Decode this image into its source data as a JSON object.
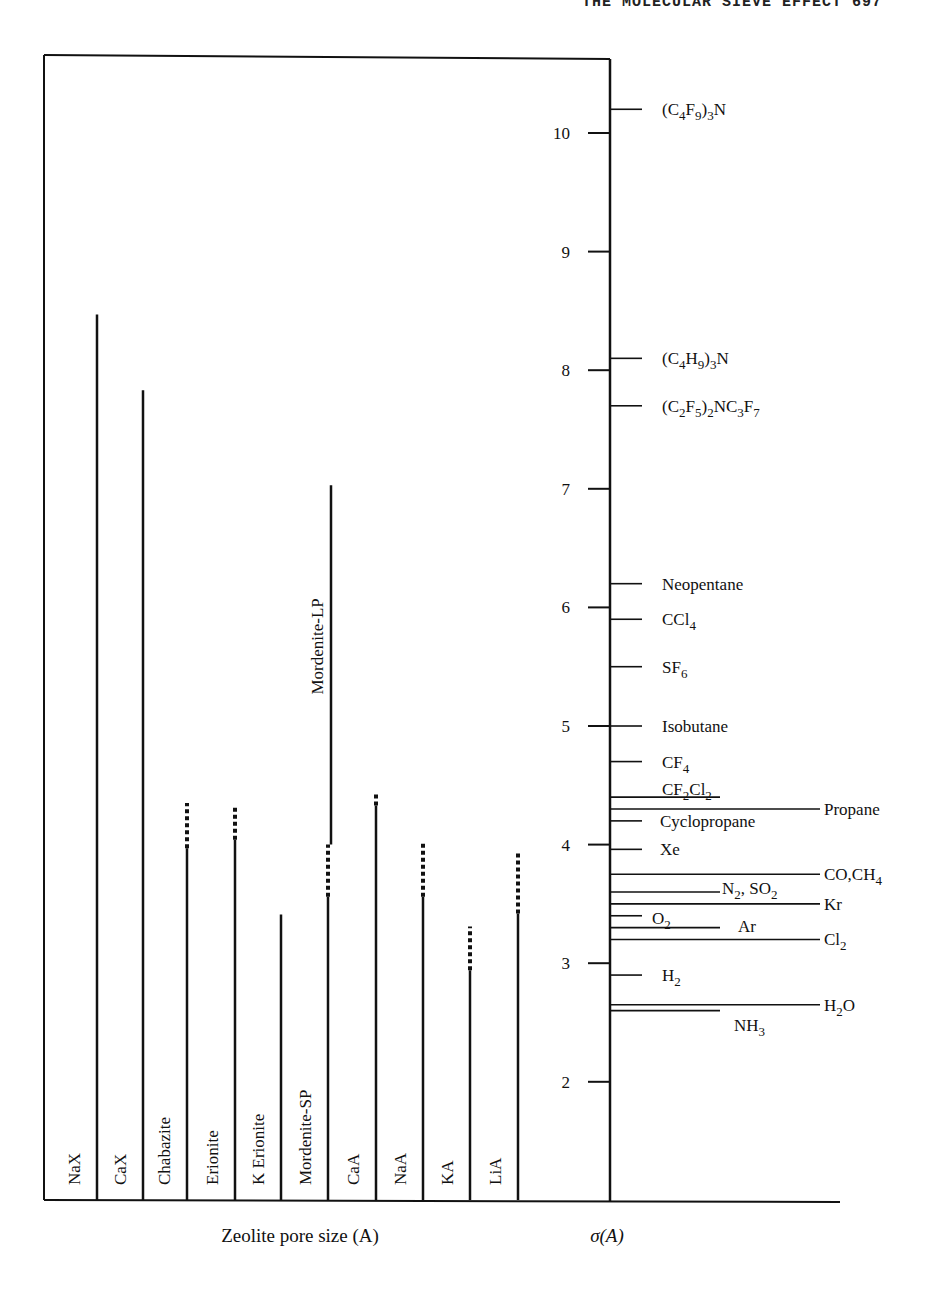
{
  "page": {
    "running_header": "THE MOLECULAR SIEVE EFFECT 697"
  },
  "chart_data": {
    "type": "bar",
    "title": "",
    "xlabel": "Zeolite pore size (A)",
    "ylabel": "σ(A)",
    "ylim": [
      1,
      10.6
    ],
    "y_ticks": [
      2,
      3,
      4,
      5,
      6,
      7,
      8,
      9,
      10
    ],
    "grid": false,
    "legend": "none",
    "categories": [
      "NaX",
      "CaX",
      "Chabazite",
      "Erionite",
      "K Erionite",
      "Mordenite-SP",
      "CaA",
      "NaA",
      "KA",
      "LiA"
    ],
    "series": [
      {
        "name": "Zeolite pore size (solid)",
        "values": [
          8.47,
          7.83,
          3.97,
          4.04,
          3.41,
          3.56,
          4.33,
          3.56,
          2.94,
          3.42
        ]
      },
      {
        "name": "Zeolite pore size (dashed upper range)",
        "values": [
          null,
          null,
          4.35,
          4.33,
          null,
          4.0,
          4.43,
          4.01,
          3.31,
          3.95
        ]
      }
    ],
    "extra_bars": [
      {
        "name": "Mordenite-LP",
        "from": 4.0,
        "to": 7.03,
        "category_index": 5
      }
    ],
    "molecules": [
      {
        "label": "(C4F9)3N",
        "sigma": 10.2,
        "line": "short"
      },
      {
        "label": "(C4H9)3N",
        "sigma": 8.1,
        "line": "short"
      },
      {
        "label": "(C2F5)2NC3F7",
        "sigma": 7.7,
        "line": "short"
      },
      {
        "label": "Neopentane",
        "sigma": 6.2,
        "line": "short"
      },
      {
        "label": "CCl4",
        "sigma": 5.9,
        "line": "short"
      },
      {
        "label": "SF6",
        "sigma": 5.5,
        "line": "short"
      },
      {
        "label": "Isobutane",
        "sigma": 5.0,
        "line": "short"
      },
      {
        "label": "CF4",
        "sigma": 4.7,
        "line": "short"
      },
      {
        "label": "CF2Cl2",
        "sigma": 4.4,
        "line": "medium"
      },
      {
        "label": "Propane",
        "sigma": 4.3,
        "line": "long"
      },
      {
        "label": "Cyclopropane",
        "sigma": 4.2,
        "line": "short"
      },
      {
        "label": "Xe",
        "sigma": 3.96,
        "line": "short"
      },
      {
        "label": "CO,CH4",
        "sigma": 3.75,
        "line": "long"
      },
      {
        "label": "N2, SO2",
        "sigma": 3.6,
        "line": "medium"
      },
      {
        "label": "Kr",
        "sigma": 3.5,
        "line": "long"
      },
      {
        "label": "O2",
        "sigma": 3.4,
        "line": "short"
      },
      {
        "label": "Ar",
        "sigma": 3.3,
        "line": "medium"
      },
      {
        "label": "Cl2",
        "sigma": 3.2,
        "line": "long"
      },
      {
        "label": "H2",
        "sigma": 2.9,
        "line": "short"
      },
      {
        "label": "H2O",
        "sigma": 2.65,
        "line": "long"
      },
      {
        "label": "NH3",
        "sigma": 2.6,
        "line": "medium"
      }
    ]
  },
  "axis": {
    "x_label": "Zeolite pore size (A)",
    "y_label": "σ(A)",
    "ticks": [
      "2",
      "3",
      "4",
      "5",
      "6",
      "7",
      "8",
      "9",
      "10"
    ]
  },
  "bars": [
    {
      "label": "NaX",
      "x": 97
    },
    {
      "label": "CaX",
      "x": 143
    },
    {
      "label": "Chabazite",
      "x": 187
    },
    {
      "label": "Erionite",
      "x": 235
    },
    {
      "label": "K Erionite",
      "x": 281
    },
    {
      "label": "Mordenite-SP",
      "x": 328
    },
    {
      "label": "CaA",
      "x": 376
    },
    {
      "label": "NaA",
      "x": 423
    },
    {
      "label": "KA",
      "x": 470
    },
    {
      "label": "LiA",
      "x": 518
    }
  ],
  "mordenite_lp_label": "Mordenite-LP"
}
